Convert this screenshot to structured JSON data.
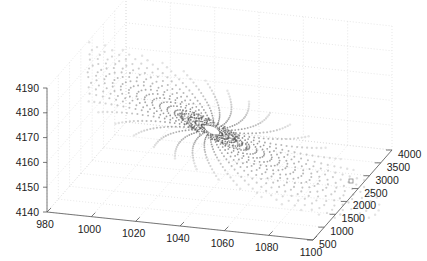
{
  "chart_data": {
    "type": "scatter",
    "subtype": "3d-mesh-points",
    "title": "",
    "xlabel": "",
    "ylabel": "",
    "zlabel": "",
    "x_ticks": [
      980,
      1000,
      1020,
      1040,
      1060,
      1080,
      1100
    ],
    "y_ticks": [
      500,
      1000,
      1500,
      2000,
      2500,
      3000,
      3500,
      4000
    ],
    "z_ticks": [
      4140,
      4150,
      4160,
      4170,
      4180,
      4190
    ],
    "xlim": [
      980,
      1100
    ],
    "ylim": [
      500,
      4000
    ],
    "zlim": [
      4140,
      4190
    ],
    "grid": true,
    "legend": null,
    "center": {
      "x": 1045,
      "y": 2200,
      "z": 4172
    },
    "rings": 22,
    "spokes": 48,
    "color": "#7a7a7a",
    "grid_color": "#d6d6d6",
    "axis_color": "#555555"
  }
}
